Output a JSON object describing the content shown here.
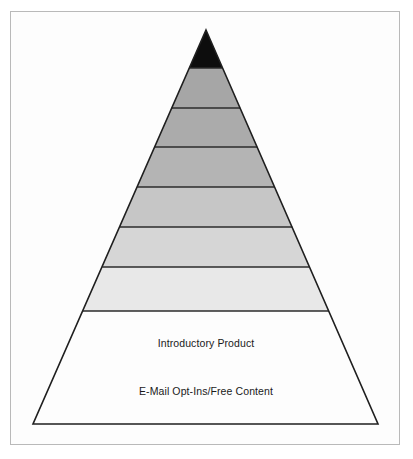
{
  "figure": {
    "kind": "pyramid-diagram",
    "title": "",
    "frame": {
      "border_color": "#b9b9b9",
      "background_color": "#fdfdfd"
    },
    "geometry": {
      "apex_x": 206,
      "apex_y": 30,
      "base_left_x": 33,
      "base_right_x": 378,
      "base_y": 424,
      "outline_color": "#1f1f1f",
      "divider_color": "#2b2b2b"
    },
    "tiers": [
      {
        "index": 1,
        "name": "apex-tier",
        "label": "",
        "fill": "#0d0d0d",
        "top_y": 30,
        "bottom_y": 68
      },
      {
        "index": 2,
        "name": "tier-2",
        "label": "",
        "fill": "#a6a6a6",
        "top_y": 68,
        "bottom_y": 108
      },
      {
        "index": 3,
        "name": "tier-3",
        "label": "",
        "fill": "#ababab",
        "top_y": 108,
        "bottom_y": 147
      },
      {
        "index": 4,
        "name": "tier-4",
        "label": "",
        "fill": "#b4b4b4",
        "top_y": 147,
        "bottom_y": 187
      },
      {
        "index": 5,
        "name": "tier-5",
        "label": "",
        "fill": "#c6c6c6",
        "top_y": 187,
        "bottom_y": 227
      },
      {
        "index": 6,
        "name": "tier-6",
        "label": "",
        "fill": "#d6d6d6",
        "top_y": 227,
        "bottom_y": 267
      },
      {
        "index": 7,
        "name": "tier-introductory-product",
        "label": "Introductory Product",
        "label_x": 206,
        "label_y": 343,
        "fill": "#e8e8e8",
        "top_y": 267,
        "bottom_y": 311
      },
      {
        "index": 8,
        "name": "tier-email-opt-ins",
        "label": "E-Mail Opt-Ins/Free Content",
        "label_x": 206,
        "label_y": 391,
        "fill": "#fdfdfd",
        "top_y": 311,
        "bottom_y": 424
      }
    ],
    "labels": {
      "introductory_product": "Introductory Product",
      "email_opt_ins": "E-Mail Opt-Ins/Free Content"
    }
  }
}
